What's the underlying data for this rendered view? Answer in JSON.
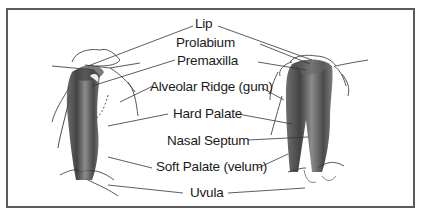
{
  "diagram": {
    "type": "anatomical-illustration",
    "colors": {
      "frame": "#5a5a5a",
      "ink": "#1a1a1a",
      "tissue": "#3a3a3a"
    },
    "labels": [
      {
        "id": "lip",
        "text": "Lip"
      },
      {
        "id": "prolabium",
        "text": "Prolabium"
      },
      {
        "id": "premaxilla",
        "text": "Premaxilla"
      },
      {
        "id": "alveolar-ridge",
        "text": "Alveolar Ridge (gum)"
      },
      {
        "id": "hard-palate",
        "text": "Hard Palate"
      },
      {
        "id": "nasal-septum",
        "text": "Nasal Septum"
      },
      {
        "id": "soft-palate",
        "text": "Soft Palate (velum)"
      },
      {
        "id": "uvula",
        "text": "Uvula"
      }
    ]
  }
}
